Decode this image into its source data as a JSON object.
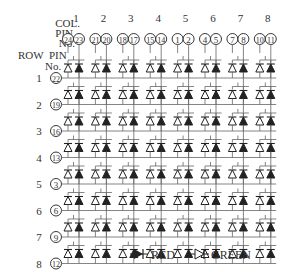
{
  "header": {
    "col_label": "COL.",
    "pin_label": "PIN",
    "no_label": "No.",
    "row_label": "ROW  PIN",
    "row_no_label": "No."
  },
  "columns": [
    {
      "col": "1",
      "pins": [
        "24",
        "23"
      ]
    },
    {
      "col": "2",
      "pins": [
        "21",
        "20"
      ]
    },
    {
      "col": "3",
      "pins": [
        "18",
        "17"
      ]
    },
    {
      "col": "4",
      "pins": [
        "15",
        "14"
      ]
    },
    {
      "col": "5",
      "pins": [
        "1",
        "2"
      ]
    },
    {
      "col": "6",
      "pins": [
        "4",
        "5"
      ]
    },
    {
      "col": "7",
      "pins": [
        "7",
        "8"
      ]
    },
    {
      "col": "8",
      "pins": [
        "10",
        "11"
      ]
    }
  ],
  "rows": [
    {
      "row": "1",
      "pin": "22"
    },
    {
      "row": "2",
      "pin": "19"
    },
    {
      "row": "3",
      "pin": "16"
    },
    {
      "row": "4",
      "pin": "13"
    },
    {
      "row": "5",
      "pin": "3"
    },
    {
      "row": "6",
      "pin": "6"
    },
    {
      "row": "7",
      "pin": "9"
    },
    {
      "row": "8",
      "pin": "12"
    }
  ],
  "legend": {
    "red_label": "RED",
    "green_label": "GREEN"
  },
  "colors": {
    "line": "#666666",
    "ink": "#222222",
    "background": "#ffffff"
  }
}
